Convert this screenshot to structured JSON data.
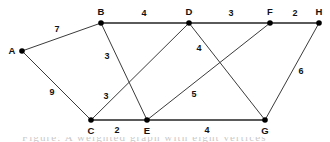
{
  "figure": {
    "background_color": "#ffffff",
    "node_color": "#000000",
    "edge_color": "#3b3b3b",
    "width": 330,
    "height": 142,
    "partial_caption": "Figure: A weighted graph with eight vertices"
  },
  "chart_data": {
    "type": "diagram",
    "subtype": "weighted-undirected-graph",
    "title": "",
    "nodes": [
      {
        "id": "A",
        "label": "A",
        "x": 22,
        "y": 51,
        "label_x": 12,
        "label_y": 51
      },
      {
        "id": "B",
        "label": "B",
        "x": 101,
        "y": 23,
        "label_x": 101,
        "label_y": 12
      },
      {
        "id": "C",
        "label": "C",
        "x": 91,
        "y": 120,
        "label_x": 91,
        "label_y": 131
      },
      {
        "id": "D",
        "label": "D",
        "x": 189,
        "y": 23,
        "label_x": 189,
        "label_y": 12
      },
      {
        "id": "E",
        "label": "E",
        "x": 147,
        "y": 120,
        "label_x": 147,
        "label_y": 131
      },
      {
        "id": "F",
        "label": "F",
        "x": 270,
        "y": 23,
        "label_x": 270,
        "label_y": 12
      },
      {
        "id": "G",
        "label": "G",
        "x": 265,
        "y": 120,
        "label_x": 265,
        "label_y": 131
      },
      {
        "id": "H",
        "label": "H",
        "x": 319,
        "y": 23,
        "label_x": 319,
        "label_y": 12
      }
    ],
    "edges": [
      {
        "from": "A",
        "to": "B",
        "weight": 7,
        "label_x": 57,
        "label_y": 29,
        "thick": false
      },
      {
        "from": "A",
        "to": "C",
        "weight": 9,
        "label_x": 52,
        "label_y": 92,
        "thick": false
      },
      {
        "from": "B",
        "to": "D",
        "weight": 4,
        "label_x": 144,
        "label_y": 13,
        "thick": true
      },
      {
        "from": "B",
        "to": "E",
        "weight": 3,
        "label_x": 107,
        "label_y": 56,
        "thick": false
      },
      {
        "from": "C",
        "to": "D",
        "weight": 3,
        "label_x": 106,
        "label_y": 96,
        "thick": false
      },
      {
        "from": "C",
        "to": "E",
        "weight": 2,
        "label_x": 117,
        "label_y": 130,
        "thick": true
      },
      {
        "from": "D",
        "to": "F",
        "weight": 3,
        "label_x": 231,
        "label_y": 13,
        "thick": true
      },
      {
        "from": "D",
        "to": "G",
        "weight": 4,
        "label_x": 199,
        "label_y": 48,
        "thick": false
      },
      {
        "from": "E",
        "to": "F",
        "weight": 5,
        "label_x": 194,
        "label_y": 94,
        "thick": false
      },
      {
        "from": "E",
        "to": "G",
        "weight": 4,
        "label_x": 207,
        "label_y": 130,
        "thick": true
      },
      {
        "from": "F",
        "to": "H",
        "weight": 2,
        "label_x": 295,
        "label_y": 13,
        "thick": true
      },
      {
        "from": "G",
        "to": "H",
        "weight": 6,
        "label_x": 301,
        "label_y": 71,
        "thick": false
      }
    ],
    "node_count": 8,
    "edge_count": 12,
    "total_weight": 52,
    "weights": [
      7,
      9,
      4,
      3,
      3,
      2,
      3,
      4,
      5,
      4,
      2,
      6
    ],
    "node_ids": [
      "A",
      "B",
      "C",
      "D",
      "E",
      "F",
      "G",
      "H"
    ],
    "legend": [],
    "xlabel": "",
    "ylabel": "",
    "grid": false
  }
}
